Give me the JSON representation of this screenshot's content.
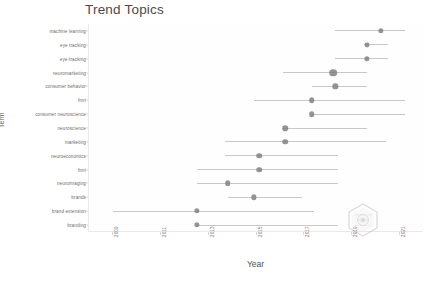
{
  "chart": {
    "title": "Trend Topics",
    "xlabel": "Year",
    "ylabel": "Term",
    "watermark_name": "bibliometrix-hex-logo"
  },
  "chart_data": {
    "type": "scatter",
    "title": "Trend Topics",
    "xlabel": "Year",
    "ylabel": "Term",
    "xlim": [
      2008,
      2022
    ],
    "grid": false,
    "legend": null,
    "xticks": [
      2009,
      2011,
      2013,
      2015,
      2017,
      2019,
      2021
    ],
    "categories": [
      "machine learning",
      "eye tracking",
      "eye-tracking",
      "neuromarketing",
      "consumer behavior",
      "fmri",
      "consumer neuroscience",
      "neuroscience",
      "marketing",
      "neuroeconomics",
      "fmri",
      "neuroimaging",
      "brands",
      "brand extension",
      "branding"
    ],
    "points": [
      {
        "term": "machine learning",
        "q1": 2018.3,
        "median": 2020.2,
        "q3": 2021.2,
        "freq": 4
      },
      {
        "term": "eye tracking",
        "q1": 2019.5,
        "median": 2019.6,
        "q3": 2020.5,
        "freq": 3
      },
      {
        "term": "eye-tracking",
        "q1": 2018.3,
        "median": 2019.6,
        "q3": 2020.5,
        "freq": 4
      },
      {
        "term": "neuromarketing",
        "q1": 2016.1,
        "median": 2018.2,
        "q3": 2019.6,
        "freq": 14
      },
      {
        "term": "consumer behavior",
        "q1": 2017.3,
        "median": 2018.3,
        "q3": 2019.6,
        "freq": 4
      },
      {
        "term": "fmri",
        "q1": 2014.9,
        "median": 2017.3,
        "q3": 2021.2,
        "freq": 5
      },
      {
        "term": "consumer neuroscience",
        "q1": 2017.3,
        "median": 2017.3,
        "q3": 2021.2,
        "freq": 5
      },
      {
        "term": "neuroscience",
        "q1": 2016.1,
        "median": 2016.2,
        "q3": 2019.6,
        "freq": 5
      },
      {
        "term": "marketing",
        "q1": 2013.7,
        "median": 2016.2,
        "q3": 2020.4,
        "freq": 5
      },
      {
        "term": "neuroeconomics",
        "q1": 2013.7,
        "median": 2015.1,
        "q3": 2018.4,
        "freq": 5
      },
      {
        "term": "fmri",
        "q1": 2012.5,
        "median": 2015.1,
        "q3": 2018.4,
        "freq": 5
      },
      {
        "term": "neuroimaging",
        "q1": 2012.5,
        "median": 2013.8,
        "q3": 2018.4,
        "freq": 5
      },
      {
        "term": "brands",
        "q1": 2013.8,
        "median": 2014.9,
        "q3": 2016.9,
        "freq": 4
      },
      {
        "term": "brand extension",
        "q1": 2009.0,
        "median": 2012.5,
        "q3": 2017.4,
        "freq": 4
      },
      {
        "term": "branding",
        "q1": 2012.5,
        "median": 2012.5,
        "q3": 2018.4,
        "freq": 4
      }
    ]
  }
}
